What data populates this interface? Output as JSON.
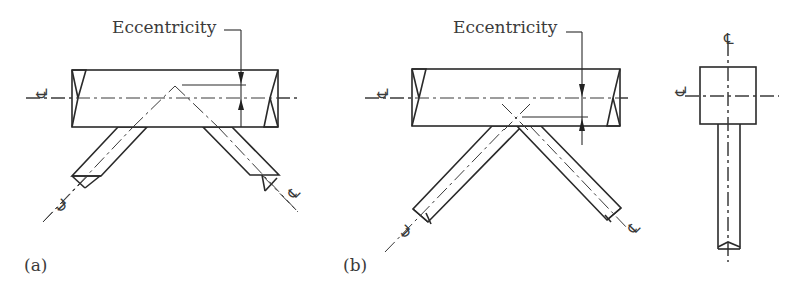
{
  "figure": {
    "panels": [
      {
        "id": "a",
        "label": "(a)",
        "annotation": "Eccentricity",
        "description": "Brace centerlines intersect above chord centerline (positive eccentricity)"
      },
      {
        "id": "b",
        "label": "(b)",
        "annotation": "Eccentricity",
        "description": "Brace centerlines intersect below chord centerline (negative eccentricity)"
      }
    ],
    "side_view": {
      "description": "Side view of chord with vertical brace"
    },
    "centerline_symbol": "℄"
  }
}
